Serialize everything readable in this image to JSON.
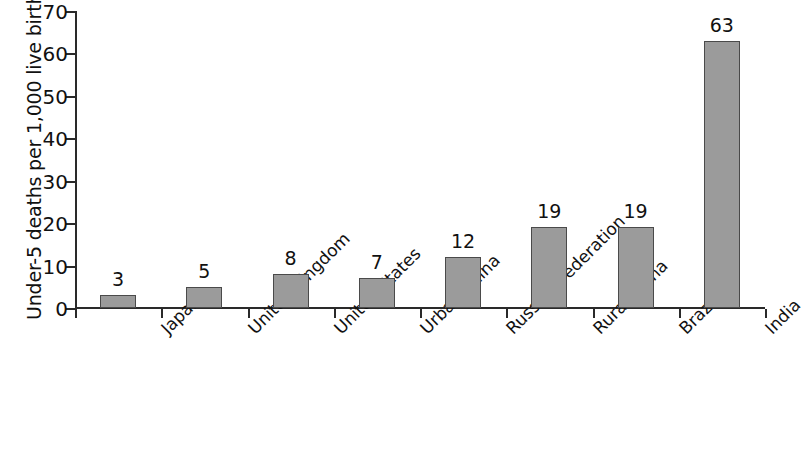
{
  "chart_data": {
    "type": "bar",
    "title": "",
    "xlabel": "",
    "ylabel": "Under-5 deaths per 1,000 live births",
    "categories": [
      "Japan",
      "United Kingdom",
      "United States",
      "Urban China",
      "Russian Federation",
      "Rural China",
      "Brazil",
      "India"
    ],
    "values": [
      3,
      5,
      8,
      7,
      12,
      19,
      19,
      63
    ],
    "value_labels": [
      "3",
      "5",
      "8",
      "7",
      "12",
      "19",
      "19",
      "63"
    ],
    "ylim": [
      0,
      70
    ],
    "yticks": [
      0,
      10,
      20,
      30,
      40,
      50,
      60,
      70
    ],
    "ytick_labels": [
      "0",
      "10",
      "20",
      "30",
      "40",
      "50",
      "60",
      "70"
    ],
    "grid": false,
    "legend": null,
    "bar_color": "#9b9b9b",
    "bar_edge_color": "#4a4a4a",
    "axis_color": "#2a2a2a",
    "background_color": "#ffffff"
  }
}
